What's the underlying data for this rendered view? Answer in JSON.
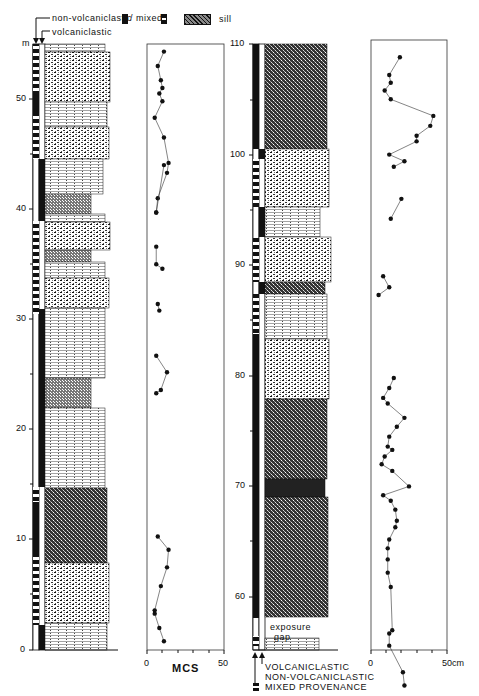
{
  "legend_top": {
    "non_volcaniclastic": "non-volcaniclastic",
    "separator": "/ mixed",
    "volcaniclastic": "volcaniclastic",
    "sill": "sill",
    "unit": "m"
  },
  "legend_bottom": {
    "volcaniclastic": "VOLCANICLASTIC",
    "non_volcaniclastic": "NON-VOLCANICLASTIC",
    "mixed": "MIXED PROVENANCE"
  },
  "exposure_gap": {
    "line1": "exposure",
    "line2": "gap"
  },
  "left_section": {
    "depth_ticks": [
      "0",
      "10",
      "20",
      "30",
      "40",
      "50"
    ],
    "mcs_axis": {
      "label": "MCS",
      "min": "0",
      "max": "50"
    }
  },
  "right_section": {
    "depth_ticks": [
      "60",
      "70",
      "80",
      "90",
      "100",
      "110"
    ],
    "mcs_axis": {
      "label": "",
      "min": "0",
      "max": "50cm"
    }
  },
  "chart_data": [
    {
      "type": "line",
      "title": "Lower section (0–55 m) maximum clast size",
      "xlabel": "MCS",
      "ylabel": "m",
      "xlim": [
        0,
        50
      ],
      "ylim": [
        0,
        55
      ],
      "segments": [
        [
          [
            11,
            54.3
          ],
          [
            7,
            53
          ],
          [
            9,
            51.7
          ],
          [
            10,
            51
          ],
          [
            8,
            50.5
          ],
          [
            10,
            49.8
          ],
          [
            5,
            48.3
          ],
          [
            11,
            46.5
          ],
          [
            14,
            44.2
          ],
          [
            13,
            43.3
          ],
          [
            7,
            41
          ],
          [
            6,
            39.7
          ]
        ],
        [
          [
            11,
            44
          ],
          [
            6,
            39.7
          ]
        ],
        [
          [
            6,
            36.6
          ],
          [
            6,
            35
          ],
          [
            10,
            34.6
          ]
        ],
        [
          [
            7,
            31.4
          ],
          [
            8,
            30.8
          ]
        ],
        [
          [
            6,
            26.7
          ],
          [
            13,
            25.2
          ],
          [
            9,
            23.6
          ],
          [
            6,
            23.3
          ]
        ],
        [
          [
            7,
            10.3
          ],
          [
            14,
            9.1
          ],
          [
            13,
            7.5
          ],
          [
            9,
            5.8
          ],
          [
            5,
            3.6
          ],
          [
            5,
            3.3
          ],
          [
            8,
            2
          ],
          [
            11,
            0.8
          ]
        ]
      ],
      "note": "values estimated from figure; y = stratigraphic height (m), x = MCS"
    },
    {
      "type": "line",
      "title": "Upper section (55–110 m) maximum clast size",
      "xlabel": "cm",
      "ylabel": "m",
      "xlim": [
        0,
        50
      ],
      "ylim": [
        55,
        110
      ],
      "segments": [
        [
          [
            19,
            108.8
          ],
          [
            12,
            107.2
          ],
          [
            13,
            106.5
          ],
          [
            9,
            105.8
          ],
          [
            13,
            105
          ],
          [
            41,
            103.5
          ],
          [
            39,
            102.6
          ],
          [
            30,
            101.7
          ],
          [
            30,
            101.2
          ],
          [
            12,
            100
          ],
          [
            22,
            99.4
          ],
          [
            15,
            98.9
          ]
        ],
        [
          [
            20,
            96
          ],
          [
            13,
            94.2
          ]
        ],
        [
          [
            8,
            89
          ],
          [
            12,
            88
          ],
          [
            5,
            87.3
          ]
        ],
        [
          [
            15,
            79.8
          ],
          [
            12,
            78.9
          ],
          [
            8,
            78
          ],
          [
            11,
            77.5
          ],
          [
            22,
            76.2
          ],
          [
            17,
            75.4
          ],
          [
            12,
            74.5
          ],
          [
            11,
            73.6
          ],
          [
            14,
            73.3
          ],
          [
            9,
            72.7
          ],
          [
            7,
            72
          ],
          [
            14,
            71.4
          ],
          [
            25,
            70
          ],
          [
            8,
            69.2
          ],
          [
            13,
            68.7
          ],
          [
            16,
            67.9
          ],
          [
            17,
            66.9
          ],
          [
            16,
            66.3
          ],
          [
            12,
            65.2
          ],
          [
            11,
            64.4
          ],
          [
            11,
            63.4
          ],
          [
            11,
            62.2
          ],
          [
            13,
            60.9
          ],
          [
            14,
            57
          ],
          [
            12,
            56.7
          ],
          [
            12,
            55.6
          ],
          [
            21,
            53.2
          ],
          [
            22,
            52
          ]
        ]
      ],
      "note": "values estimated from figure; y = stratigraphic height (m), x = MCS (cm)"
    }
  ]
}
